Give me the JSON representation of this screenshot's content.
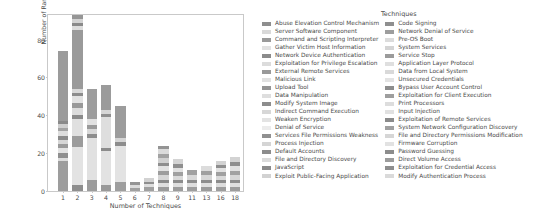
{
  "chart_data": {
    "type": "bar",
    "subtype": "stacked-bar",
    "title": "",
    "xlabel": "Number of Techniques",
    "ylabel": "Number of Ransomware",
    "legend_title": "Techniques",
    "legend_position": "right",
    "grid": false,
    "ylim": [
      0,
      93
    ],
    "yticks": [
      0,
      20,
      40,
      60,
      80
    ],
    "ytick_labels": [
      "0",
      "20",
      "40",
      "60",
      "80"
    ],
    "categories": [
      "1",
      "2",
      "3",
      "4",
      "5",
      "6",
      "7",
      "8",
      "9",
      "11",
      "13",
      "16",
      "18"
    ],
    "xtick_labels": [
      "1",
      "2",
      "3",
      "4",
      "5",
      "6",
      "7",
      "8",
      "9",
      "11",
      "13",
      "16",
      "18"
    ],
    "totals": [
      74,
      93,
      54,
      56,
      45,
      5,
      7,
      24,
      17,
      11,
      13,
      16,
      18
    ],
    "bars": [
      {
        "category": "1",
        "total": 74,
        "segments": [
          {
            "value": 16,
            "color": "#9d9d9d"
          },
          {
            "value": 1.5,
            "color": "#dcdcdc"
          },
          {
            "value": 2.5,
            "color": "#8f8f8f"
          },
          {
            "value": 3,
            "color": "#e2e2e2"
          },
          {
            "value": 2,
            "color": "#9a9a9a"
          },
          {
            "value": 2,
            "color": "#d6d6d6"
          },
          {
            "value": 2,
            "color": "#8c8c8c"
          },
          {
            "value": 3,
            "color": "#dedede"
          },
          {
            "value": 1.5,
            "color": "#a4a4a4"
          },
          {
            "value": 2,
            "color": "#cfcfcf"
          },
          {
            "value": 1.5,
            "color": "#8a8a8a"
          },
          {
            "value": 37,
            "color": "#9b9b9b"
          }
        ]
      },
      {
        "category": "2",
        "total": 93,
        "segments": [
          {
            "value": 3,
            "color": "#8e8e8e"
          },
          {
            "value": 20,
            "color": "#e3e3e3"
          },
          {
            "value": 6,
            "color": "#9c9c9c"
          },
          {
            "value": 9,
            "color": "#e0e0e0"
          },
          {
            "value": 2,
            "color": "#8b8b8b"
          },
          {
            "value": 4,
            "color": "#dcdcdc"
          },
          {
            "value": 2.5,
            "color": "#999999"
          },
          {
            "value": 3.5,
            "color": "#e2e2e2"
          },
          {
            "value": 2,
            "color": "#8d8d8d"
          },
          {
            "value": 2,
            "color": "#d9d9d9"
          },
          {
            "value": 31,
            "color": "#9a9a9a"
          },
          {
            "value": 2,
            "color": "#dddddd"
          },
          {
            "value": 2,
            "color": "#8a8a8a"
          },
          {
            "value": 2,
            "color": "#d3d3d3"
          },
          {
            "value": 2,
            "color": "#969696"
          }
        ]
      },
      {
        "category": "3",
        "total": 54,
        "segments": [
          {
            "value": 6,
            "color": "#9c9c9c"
          },
          {
            "value": 22,
            "color": "#e1e1e1"
          },
          {
            "value": 2,
            "color": "#8d8d8d"
          },
          {
            "value": 3,
            "color": "#d8d8d8"
          },
          {
            "value": 2,
            "color": "#9a9a9a"
          },
          {
            "value": 3,
            "color": "#e1e1e1"
          },
          {
            "value": 16,
            "color": "#9d9d9d"
          }
        ]
      },
      {
        "category": "4",
        "total": 56,
        "segments": [
          {
            "value": 3,
            "color": "#999999"
          },
          {
            "value": 18,
            "color": "#e2e2e2"
          },
          {
            "value": 2,
            "color": "#8c8c8c"
          },
          {
            "value": 16,
            "color": "#dedede"
          },
          {
            "value": 1.5,
            "color": "#8f8f8f"
          },
          {
            "value": 2.5,
            "color": "#d6d6d6"
          },
          {
            "value": 13,
            "color": "#9b9b9b"
          }
        ]
      },
      {
        "category": "5",
        "total": 45,
        "segments": [
          {
            "value": 5,
            "color": "#9e9e9e"
          },
          {
            "value": 19,
            "color": "#e3e3e3"
          },
          {
            "value": 2,
            "color": "#8d8d8d"
          },
          {
            "value": 2,
            "color": "#d5d5d5"
          },
          {
            "value": 17,
            "color": "#9c9c9c"
          }
        ]
      },
      {
        "category": "6",
        "total": 5,
        "segments": [
          {
            "value": 1.5,
            "color": "#a0a0a0"
          },
          {
            "value": 1.5,
            "color": "#dcdcdc"
          },
          {
            "value": 2,
            "color": "#949494"
          }
        ]
      },
      {
        "category": "7",
        "total": 7,
        "segments": [
          {
            "value": 2,
            "color": "#a0a0a0"
          },
          {
            "value": 1.5,
            "color": "#dedede"
          },
          {
            "value": 1.5,
            "color": "#8f8f8f"
          },
          {
            "value": 2,
            "color": "#d2d2d2"
          }
        ]
      },
      {
        "category": "8",
        "total": 24,
        "segments": [
          {
            "value": 2,
            "color": "#9b9b9b"
          },
          {
            "value": 2,
            "color": "#dfdfdf"
          },
          {
            "value": 2,
            "color": "#8c8c8c"
          },
          {
            "value": 2.5,
            "color": "#d6d6d6"
          },
          {
            "value": 2,
            "color": "#9d9d9d"
          },
          {
            "value": 2.5,
            "color": "#e2e2e2"
          },
          {
            "value": 2,
            "color": "#8e8e8e"
          },
          {
            "value": 2.5,
            "color": "#d0d0d0"
          },
          {
            "value": 2,
            "color": "#a2a2a2"
          },
          {
            "value": 2.5,
            "color": "#dbdbdb"
          },
          {
            "value": 2,
            "color": "#949494"
          }
        ]
      },
      {
        "category": "9",
        "total": 17,
        "segments": [
          {
            "value": 2,
            "color": "#9c9c9c"
          },
          {
            "value": 2,
            "color": "#dedede"
          },
          {
            "value": 2,
            "color": "#8d8d8d"
          },
          {
            "value": 2,
            "color": "#d9d9d9"
          },
          {
            "value": 2,
            "color": "#a0a0a0"
          },
          {
            "value": 2,
            "color": "#e1e1e1"
          },
          {
            "value": 2.5,
            "color": "#8f8f8f"
          },
          {
            "value": 2.5,
            "color": "#d4d4d4"
          }
        ]
      },
      {
        "category": "11",
        "total": 11,
        "segments": [
          {
            "value": 2,
            "color": "#9e9e9e"
          },
          {
            "value": 2,
            "color": "#dedede"
          },
          {
            "value": 2,
            "color": "#8e8e8e"
          },
          {
            "value": 2.5,
            "color": "#d8d8d8"
          },
          {
            "value": 2.5,
            "color": "#a1a1a1"
          }
        ]
      },
      {
        "category": "13",
        "total": 13,
        "segments": [
          {
            "value": 2,
            "color": "#9b9b9b"
          },
          {
            "value": 2,
            "color": "#e0e0e0"
          },
          {
            "value": 2,
            "color": "#8d8d8d"
          },
          {
            "value": 2.5,
            "color": "#d7d7d7"
          },
          {
            "value": 2,
            "color": "#a0a0a0"
          },
          {
            "value": 2.5,
            "color": "#dcdcdc"
          }
        ]
      },
      {
        "category": "16",
        "total": 16,
        "segments": [
          {
            "value": 2,
            "color": "#9d9d9d"
          },
          {
            "value": 2,
            "color": "#dddddd"
          },
          {
            "value": 2,
            "color": "#8c8c8c"
          },
          {
            "value": 2,
            "color": "#d9d9d9"
          },
          {
            "value": 2,
            "color": "#a0a0a0"
          },
          {
            "value": 2,
            "color": "#e2e2e2"
          },
          {
            "value": 2,
            "color": "#8f8f8f"
          },
          {
            "value": 2,
            "color": "#d2d2d2"
          }
        ]
      },
      {
        "category": "18",
        "total": 18,
        "segments": [
          {
            "value": 2,
            "color": "#9c9c9c"
          },
          {
            "value": 2,
            "color": "#dfdfdf"
          },
          {
            "value": 2,
            "color": "#8d8d8d"
          },
          {
            "value": 2.5,
            "color": "#d6d6d6"
          },
          {
            "value": 2,
            "color": "#a1a1a1"
          },
          {
            "value": 2.5,
            "color": "#e1e1e1"
          },
          {
            "value": 2.5,
            "color": "#8e8e8e"
          },
          {
            "value": 2.5,
            "color": "#d3d3d3"
          }
        ]
      }
    ],
    "legend": {
      "title": "Techniques",
      "columns": [
        [
          {
            "label": "Abuse Elevation Control Mechanism",
            "color": "#8e8e8e"
          },
          {
            "label": "Server Software Component",
            "color": "#d9d9d9"
          },
          {
            "label": "Command and Scripting Interpreter",
            "color": "#9a9a9a"
          },
          {
            "label": "Gather Victim Host Information",
            "color": "#e2e2e2"
          },
          {
            "label": "Network Device Authentication",
            "color": "#8b8b8b"
          },
          {
            "label": "Exploitation for Privilege Escalation",
            "color": "#dcdcdc"
          },
          {
            "label": "External Remote Services",
            "color": "#999999"
          },
          {
            "label": "Malicious Link",
            "color": "#e1e1e1"
          },
          {
            "label": "Upload Tool",
            "color": "#949494"
          },
          {
            "label": "Data Manipulation",
            "color": "#dedede"
          },
          {
            "label": "Modify System Image",
            "color": "#8d8d8d"
          },
          {
            "label": "Indirect Command Execution",
            "color": "#d7d7d7"
          },
          {
            "label": "Weaken Encryption",
            "color": "#e3e3e3"
          },
          {
            "label": "Denial of Service",
            "color": "#ececec"
          },
          {
            "label": "Services File Permissions Weakness",
            "color": "#909090"
          },
          {
            "label": "Process Injection",
            "color": "#d5d5d5"
          },
          {
            "label": "Default Accounts",
            "color": "#8c8c8c"
          },
          {
            "label": "File and Directory Discovery",
            "color": "#dbdbdb"
          },
          {
            "label": "JavaScript",
            "color": "#8a8a8a"
          },
          {
            "label": "Exploit Public-Facing Application",
            "color": "#d2d2d2"
          }
        ],
        [
          {
            "label": "Code Signing",
            "color": "#8f8f8f"
          },
          {
            "label": "Network Denial of Service",
            "color": "#9d9d9d"
          },
          {
            "label": "Pre-OS Boot",
            "color": "#dcdcdc"
          },
          {
            "label": "System Services",
            "color": "#d4d4d4"
          },
          {
            "label": "Service Stop",
            "color": "#9b9b9b"
          },
          {
            "label": "Application Layer Protocol",
            "color": "#dfdfdf"
          },
          {
            "label": "Data from Local System",
            "color": "#d9d9d9"
          },
          {
            "label": "Unsecured Credentials",
            "color": "#e3e3e3"
          },
          {
            "label": "Bypass User Account Control",
            "color": "#8d8d8d"
          },
          {
            "label": "Exploitation for Client Execution",
            "color": "#9e9e9e"
          },
          {
            "label": "Print Processors",
            "color": "#dddddd"
          },
          {
            "label": "Input Injection",
            "color": "#e1e1e1"
          },
          {
            "label": "Exploitation of Remote Services",
            "color": "#8b8b8b"
          },
          {
            "label": "System Network Configuration Discovery",
            "color": "#a0a0a0"
          },
          {
            "label": "File and Directory Permissions Modification",
            "color": "#d6d6d6"
          },
          {
            "label": "Firmware Corruption",
            "color": "#e2e2e2"
          },
          {
            "label": "Password Guessing",
            "color": "#8c8c8c"
          },
          {
            "label": "Direct Volume Access",
            "color": "#9c9c9c"
          },
          {
            "label": "Exploitation for Credential Access",
            "color": "#8e8e8e"
          },
          {
            "label": "Modify Authentication Process",
            "color": "#dadada"
          }
        ]
      ]
    }
  }
}
